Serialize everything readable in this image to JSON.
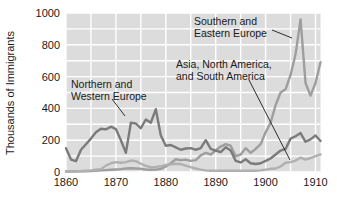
{
  "chart_data": {
    "type": "line",
    "title": "",
    "subtitle": "",
    "xlabel": "",
    "ylabel": "Thousands of Immigrants",
    "xlim": [
      1860,
      1911
    ],
    "ylim": [
      0,
      1000
    ],
    "grid": true,
    "grid_x_step": 5,
    "grid_y_step": 100,
    "legend_position": "inline-annotations",
    "xticks": [
      "1860",
      "1870",
      "1880",
      "1890",
      "1900",
      "1910"
    ],
    "xtick_values": [
      1860,
      1870,
      1880,
      1890,
      1900,
      1910
    ],
    "yticks": [
      "0",
      "200",
      "400",
      "600",
      "800",
      "1000"
    ],
    "ytick_values": [
      0,
      200,
      400,
      600,
      800,
      1000
    ],
    "series": [
      {
        "name": "Northern and Western Europe",
        "color": "#7b7b7b",
        "x": [
          1860,
          1861,
          1862,
          1863,
          1864,
          1865,
          1866,
          1867,
          1868,
          1869,
          1870,
          1871,
          1872,
          1873,
          1874,
          1875,
          1876,
          1877,
          1878,
          1879,
          1880,
          1881,
          1882,
          1883,
          1884,
          1885,
          1886,
          1887,
          1888,
          1889,
          1890,
          1891,
          1892,
          1893,
          1894,
          1895,
          1896,
          1897,
          1898,
          1899,
          1900,
          1901,
          1902,
          1903,
          1904,
          1905,
          1906,
          1907,
          1908,
          1909,
          1910,
          1911
        ],
        "values": [
          150,
          78,
          68,
          140,
          175,
          210,
          250,
          272,
          268,
          285,
          270,
          200,
          120,
          310,
          305,
          275,
          330,
          310,
          395,
          230,
          165,
          170,
          155,
          140,
          148,
          150,
          140,
          150,
          200,
          145,
          135,
          125,
          155,
          135,
          70,
          60,
          80,
          55,
          50,
          55,
          70,
          85,
          110,
          135,
          145,
          210,
          225,
          245,
          190,
          205,
          230,
          195
        ]
      },
      {
        "name": "Southern and Eastern Europe",
        "color": "#9e9e9e",
        "x": [
          1860,
          1861,
          1862,
          1863,
          1864,
          1865,
          1866,
          1867,
          1868,
          1869,
          1870,
          1871,
          1872,
          1873,
          1874,
          1875,
          1876,
          1877,
          1878,
          1879,
          1880,
          1881,
          1882,
          1883,
          1884,
          1885,
          1886,
          1887,
          1888,
          1889,
          1890,
          1891,
          1892,
          1893,
          1894,
          1895,
          1896,
          1897,
          1898,
          1899,
          1900,
          1901,
          1902,
          1903,
          1904,
          1905,
          1906,
          1907,
          1908,
          1909,
          1910,
          1911
        ],
        "values": [
          3,
          3,
          3,
          4,
          5,
          6,
          8,
          10,
          12,
          14,
          16,
          18,
          22,
          24,
          22,
          20,
          16,
          14,
          15,
          20,
          35,
          55,
          80,
          75,
          78,
          70,
          75,
          105,
          120,
          110,
          135,
          160,
          175,
          165,
          100,
          110,
          150,
          120,
          145,
          175,
          250,
          310,
          420,
          500,
          520,
          610,
          740,
          960,
          560,
          480,
          560,
          690
        ]
      },
      {
        "name": "Asia, North America, and South America",
        "color": "#b0b0b0",
        "x": [
          1860,
          1861,
          1862,
          1863,
          1864,
          1865,
          1866,
          1867,
          1868,
          1869,
          1870,
          1871,
          1872,
          1873,
          1874,
          1875,
          1876,
          1877,
          1878,
          1879,
          1880,
          1881,
          1882,
          1883,
          1884,
          1885,
          1886,
          1887,
          1888,
          1889,
          1890,
          1891,
          1892,
          1893,
          1894,
          1895,
          1896,
          1897,
          1898,
          1899,
          1900,
          1901,
          1902,
          1903,
          1904,
          1905,
          1906,
          1907,
          1908,
          1909,
          1910,
          1911
        ],
        "values": [
          5,
          5,
          5,
          6,
          8,
          10,
          14,
          18,
          40,
          55,
          62,
          58,
          62,
          72,
          68,
          52,
          38,
          30,
          32,
          36,
          45,
          48,
          52,
          50,
          40,
          30,
          22,
          15,
          10,
          8,
          8,
          8,
          8,
          8,
          8,
          8,
          8,
          8,
          8,
          10,
          15,
          20,
          22,
          35,
          58,
          62,
          72,
          90,
          78,
          88,
          100,
          110
        ]
      }
    ],
    "annotations": [
      {
        "label_line1": "Northern and",
        "label_line2": "Western Europe",
        "text_x": 71,
        "text_y": 88,
        "leader": [
          [
            112,
            99
          ],
          [
            125,
            116
          ]
        ]
      },
      {
        "label_line1": "Asia, North America,",
        "label_line2": "and South America",
        "text_x": 176,
        "text_y": 68,
        "leader": [
          [
            249,
            80
          ],
          [
            290,
            160
          ]
        ]
      },
      {
        "label_line1": "Southern and",
        "label_line2": "Eastern Europe",
        "text_x": 194,
        "text_y": 25,
        "leader": [
          [
            272,
            30
          ],
          [
            292,
            38
          ]
        ]
      }
    ],
    "colors": {
      "plot_background": "#dcdcdc",
      "gridline": "#ffffff",
      "axis_text": "#1a1a1a",
      "page_background": "#ffffff"
    }
  }
}
